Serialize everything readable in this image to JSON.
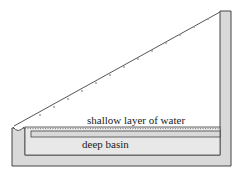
{
  "labels": {
    "shallow": "shallow layer of water",
    "deep": "deep basin"
  },
  "colors": {
    "wall": "#d9d9d9",
    "stroke": "#444444",
    "glass": "#555555",
    "water": "#888888"
  }
}
